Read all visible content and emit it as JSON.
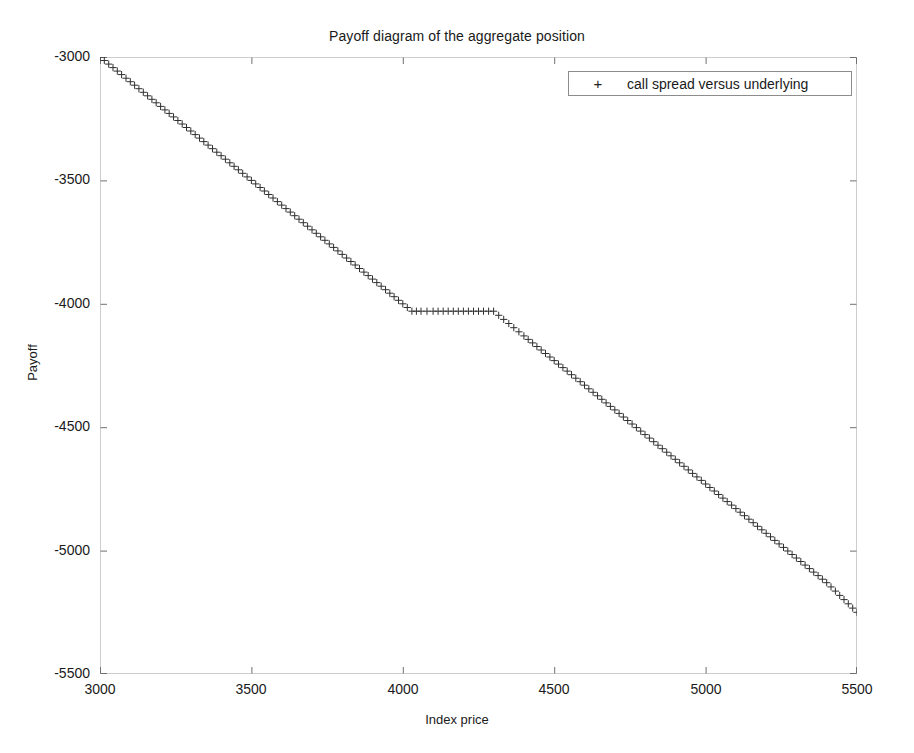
{
  "chart_data": {
    "type": "line",
    "title": "Payoff diagram of the aggregate position",
    "xlabel": "Index price",
    "ylabel": "Payoff",
    "xlim": [
      3000,
      5500
    ],
    "ylim": [
      -5500,
      -3000
    ],
    "xticks": [
      3000,
      3500,
      4000,
      4500,
      5000,
      5500
    ],
    "yticks": [
      -5500,
      -5000,
      -4500,
      -4000,
      -3500,
      -3000
    ],
    "xtick_labels": [
      "3000",
      "3500",
      "4000",
      "4500",
      "5000",
      "5500"
    ],
    "ytick_labels": [
      "-5500",
      "-5000",
      "-4500",
      "-4000",
      "-3500",
      "-3000"
    ],
    "grid": false,
    "legend_position": "upper right",
    "marker": "+",
    "marker_color": "#303030",
    "series": [
      {
        "name": "call spread versus underlying",
        "x": [
          3000,
          3100,
          3200,
          3300,
          3400,
          3500,
          3600,
          3700,
          3800,
          3900,
          4000,
          4030,
          4060,
          4100,
          4150,
          4200,
          4250,
          4300,
          4350,
          4400,
          4500,
          4600,
          4700,
          4800,
          4900,
          5000,
          5100,
          5200,
          5300,
          5400,
          5500
        ],
        "y": [
          -3000,
          -3100,
          -3200,
          -3300,
          -3400,
          -3500,
          -3600,
          -3700,
          -3800,
          -3900,
          -4000,
          -4030,
          -4030,
          -4030,
          -4030,
          -4030,
          -4030,
          -4030,
          -4080,
          -4130,
          -4230,
          -4330,
          -4430,
          -4530,
          -4630,
          -4730,
          -4830,
          -4930,
          -5030,
          -5130,
          -5250
        ]
      }
    ],
    "annotations": []
  },
  "legend": {
    "marker_glyph": "+",
    "entries": [
      {
        "label": "call spread versus underlying"
      }
    ]
  }
}
